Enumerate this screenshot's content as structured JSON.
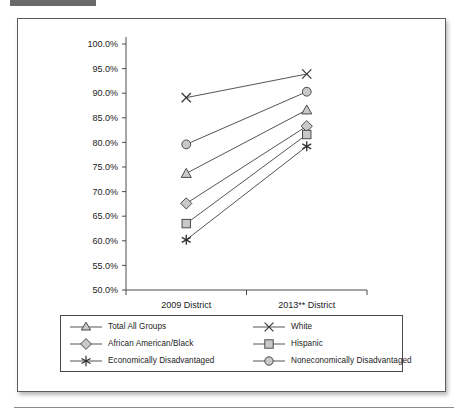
{
  "page": {
    "top_bar_color": "#6a6a6a",
    "rule_color": "#8c8c8c"
  },
  "figure": {
    "border_color": "#5c5c5c",
    "background": "#ffffff"
  },
  "chart_data": {
    "type": "line",
    "title": "",
    "subtitle": "",
    "xlabel": "",
    "ylabel": "",
    "categories": [
      "2009 District",
      "2013** District"
    ],
    "x_tick_labels": [
      "2009 District",
      "2013** District"
    ],
    "y_tick_labels": [
      "50.0%",
      "55.0%",
      "60.0%",
      "65.0%",
      "70.0%",
      "75.0%",
      "80.0%",
      "85.0%",
      "90.0%",
      "95.0%",
      "100.0%"
    ],
    "y_tick_values": [
      50,
      55,
      60,
      65,
      70,
      75,
      80,
      85,
      90,
      95,
      100
    ],
    "ylim": [
      50,
      100
    ],
    "grid": false,
    "legend_position": "below-plot",
    "marker_fill": "#c9c9c9",
    "line_color": "#555555",
    "series": [
      {
        "name": "Total All Groups",
        "marker": "triangle",
        "values": [
          73.7,
          86.6
        ]
      },
      {
        "name": "White",
        "marker": "x",
        "values": [
          89.1,
          93.9
        ]
      },
      {
        "name": "African American/Black",
        "marker": "diamond",
        "values": [
          67.6,
          83.3
        ]
      },
      {
        "name": "Hispanic",
        "marker": "square",
        "values": [
          63.5,
          81.6
        ]
      },
      {
        "name": "Economically Disadvantaged",
        "marker": "asterisk",
        "values": [
          60.2,
          79.2
        ]
      },
      {
        "name": "Noneconomically Disadvantaged",
        "marker": "circle",
        "values": [
          79.6,
          90.3
        ]
      }
    ]
  },
  "legend": {
    "entries": [
      {
        "label": "Total All Groups",
        "marker": "triangle"
      },
      {
        "label": "White",
        "marker": "x"
      },
      {
        "label": "African American/Black",
        "marker": "diamond"
      },
      {
        "label": "Hispanic",
        "marker": "square"
      },
      {
        "label": "Economically Disadvantaged",
        "marker": "asterisk"
      },
      {
        "label": "Noneconomically Disadvantaged",
        "marker": "circle"
      }
    ]
  }
}
